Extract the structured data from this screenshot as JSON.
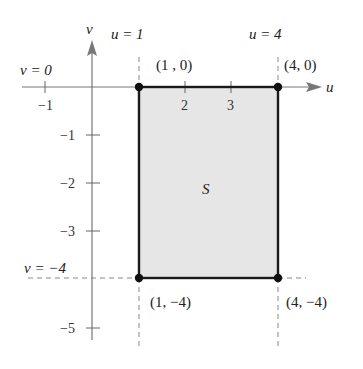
{
  "diagram": {
    "type": "region-in-uv-plane",
    "axes": {
      "horizontal_label": "u",
      "vertical_label": "v",
      "u_ticks": [
        {
          "value": -1,
          "label": "−1"
        },
        {
          "value": 2,
          "label": "2"
        },
        {
          "value": 3,
          "label": "3"
        }
      ],
      "v_ticks": [
        {
          "value": -1,
          "label": "−1"
        },
        {
          "value": -2,
          "label": "−2"
        },
        {
          "value": -3,
          "label": "−3"
        },
        {
          "value": -5,
          "label": "−5"
        }
      ]
    },
    "boundary_lines": {
      "u1": "u = 1",
      "u4": "u = 4",
      "v0": "v = 0",
      "vm4": "v = −4"
    },
    "region": {
      "label": "S",
      "fill_color": "#e6e6e6",
      "border_color": "#1a1a1a"
    },
    "vertices": [
      {
        "label": "(1 , 0)",
        "u": 1,
        "v": 0
      },
      {
        "label": "(4, 0)",
        "u": 4,
        "v": 0
      },
      {
        "label": "(1, −4)",
        "u": 1,
        "v": -4
      },
      {
        "label": "(4, −4)",
        "u": 4,
        "v": -4
      }
    ]
  }
}
